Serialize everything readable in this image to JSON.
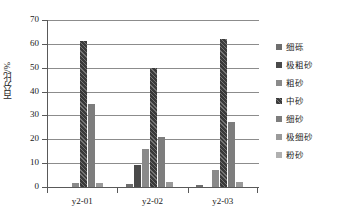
{
  "chart_data": {
    "type": "bar",
    "title": "",
    "xlabel": "",
    "ylabel": "百分比/%",
    "ylim": [
      0,
      70
    ],
    "yticks": [
      0,
      10,
      20,
      30,
      40,
      50,
      60,
      70
    ],
    "grid": true,
    "legend_position": "right",
    "categories": [
      "y2-01",
      "y2-02",
      "y2-03"
    ],
    "series": [
      {
        "name": "细砾",
        "color": "#6e6e6e",
        "values": [
          0.0,
          1.3,
          0.8
        ]
      },
      {
        "name": "极粗砂",
        "color": "#4a4a4a",
        "values": [
          0.0,
          9.4,
          0.0
        ]
      },
      {
        "name": "粗砂",
        "color": "#8a8a8a",
        "values": [
          1.6,
          16.0,
          7.1
        ]
      },
      {
        "name": "中砂",
        "color": "#3a3a3a",
        "values": [
          61.2,
          49.8,
          62.2
        ]
      },
      {
        "name": "细砂",
        "color": "#7d7d7d",
        "values": [
          34.8,
          20.9,
          27.3
        ]
      },
      {
        "name": "极细砂",
        "color": "#9a9a9a",
        "values": [
          1.6,
          2.2,
          2.3
        ]
      },
      {
        "name": "粉砂",
        "color": "#b0b0b0",
        "values": [
          0.0,
          0.0,
          0.0
        ]
      }
    ]
  },
  "legend": {
    "items": [
      {
        "label": "细砾"
      },
      {
        "label": "极粗砂"
      },
      {
        "label": "粗砂"
      },
      {
        "label": "中砂"
      },
      {
        "label": "细砂"
      },
      {
        "label": "极细砂"
      },
      {
        "label": "粉砂"
      }
    ]
  }
}
